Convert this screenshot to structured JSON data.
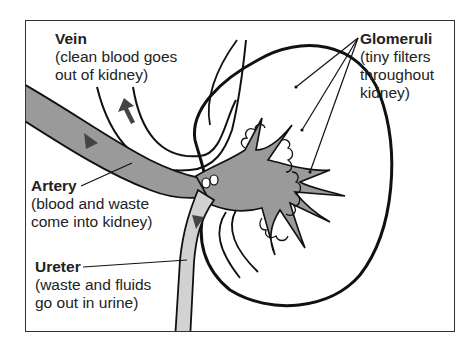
{
  "diagram": {
    "colors": {
      "outline": "#1a1a1a",
      "vessel_fill": "#9a9a9a",
      "ureter_fill": "#d2d2d2",
      "background": "#ffffff"
    },
    "labels": {
      "vein": {
        "title": "Vein",
        "line1": "(clean blood goes",
        "line2": "out of kidney)"
      },
      "glomeruli": {
        "title": "Glomeruli",
        "line1": "(tiny filters",
        "line2": "throughout",
        "line3": "kidney)"
      },
      "artery": {
        "title": "Artery",
        "line1": "(blood and waste",
        "line2": "come into kidney)"
      },
      "ureter": {
        "title": "Ureter",
        "line1": "(waste and fluids",
        "line2": "go out in urine)"
      }
    }
  }
}
